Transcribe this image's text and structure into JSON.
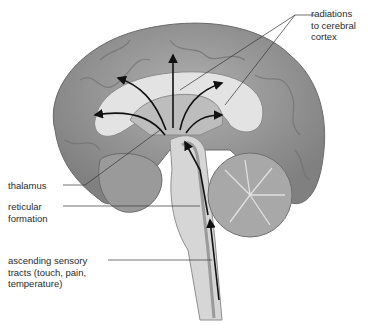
{
  "figure": {
    "labels": {
      "radiations": "radiations\nto cerebral\ncortex",
      "thalamus": "thalamus",
      "reticular": "reticular\nformation",
      "ascending": "ascending sensory\ntracts (touch, pain,\ntemperature)"
    },
    "colors": {
      "brain_outer": "#8f8f8f",
      "brain_inner": "#b9b9b9",
      "ventricle": "#e6e6e6",
      "brainstem": "#d2d2d2",
      "cerebellum": "#a4a4a4",
      "arrow": "#111111",
      "leader": "#333333",
      "text": "#2a2a2a"
    }
  }
}
